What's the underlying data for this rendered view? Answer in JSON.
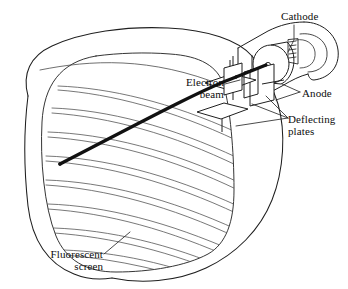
{
  "figure": {
    "type": "technical-line-diagram",
    "background_color": "#ffffff",
    "line_color": "#1a1a1a",
    "thin_line_color": "#3a3a3a",
    "beam_color": "#111111"
  },
  "labels": {
    "cathode": "Cathode",
    "anode": "Anode",
    "electron_beam_line1": "Electron",
    "electron_beam_line2": "beam",
    "deflecting_line1": "Deflecting",
    "deflecting_line2": "plates",
    "fluorescent_line1": "Fluorescent",
    "fluorescent_line2": "screen"
  },
  "parts": [
    {
      "name": "cathode",
      "label": "Cathode"
    },
    {
      "name": "anode",
      "label": "Anode"
    },
    {
      "name": "electron-beam",
      "label": "Electron beam"
    },
    {
      "name": "deflecting-plates",
      "label": "Deflecting plates"
    },
    {
      "name": "fluorescent-screen",
      "label": "Fluorescent screen"
    }
  ]
}
